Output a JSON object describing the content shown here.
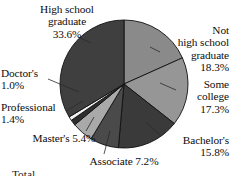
{
  "chart_data": {
    "type": "pie",
    "title": "",
    "subtitle": "",
    "xlabel": "",
    "ylabel": "",
    "legend_position": "none",
    "grid": false,
    "units": "percent",
    "start_angle_deg": 0,
    "direction": "clockwise",
    "categories": [
      "Not high school graduate",
      "Some college",
      "Bachelor's",
      "Associate",
      "Master's",
      "Professional",
      "Doctor's",
      "High school graduate"
    ],
    "values": [
      18.3,
      17.3,
      15.8,
      7.2,
      5.4,
      1.4,
      1.0,
      33.6
    ],
    "colors": [
      "#8a8a8a",
      "#969696",
      "#3a3a3a",
      "#4a4a4a",
      "#a9a9a9",
      "#2e2e2e",
      "#f2f2f2",
      "#3f3f3f"
    ],
    "slices": [
      {
        "label": "Not high school graduate",
        "value": 18.3,
        "color": "#8a8a8a"
      },
      {
        "label": "Some college",
        "value": 17.3,
        "color": "#969696"
      },
      {
        "label": "Bachelor's",
        "value": 15.8,
        "color": "#3a3a3a"
      },
      {
        "label": "Associate",
        "value": 7.2,
        "color": "#4a4a4a"
      },
      {
        "label": "Master's",
        "value": 5.4,
        "color": "#a9a9a9"
      },
      {
        "label": "Professional",
        "value": 1.4,
        "color": "#2e2e2e"
      },
      {
        "label": "Doctor's",
        "value": 1.0,
        "color": "#f2f2f2"
      },
      {
        "label": "High school graduate",
        "value": 33.6,
        "color": "#3f3f3f"
      }
    ]
  },
  "labels": {
    "high_school_graduate": "High school\ngraduate\n33.6%",
    "not_high_school_graduate": "Not\nhigh school\ngraduate\n18.3%",
    "some_college": "Some\ncollege\n17.3%",
    "bachelors": "Bachelor's\n15.8%",
    "associate": "Associate 7.2%",
    "masters": "Master's 5.4%",
    "professional": "Professional\n1.4%",
    "doctors": "Doctor's\n1.0%"
  },
  "bottom_cropped_text": "Total"
}
